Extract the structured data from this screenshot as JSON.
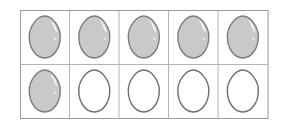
{
  "figure": {
    "type": "egg-grid",
    "background_color": "#ffffff",
    "rows": 2,
    "columns": 5,
    "total_cells": 10,
    "filled_count": 6,
    "empty_count": 4,
    "fraction_shaded": "6/10"
  },
  "grid": {
    "left": 20,
    "top": 10,
    "right": 267.6,
    "bottom": 118,
    "cell_width": 49.52,
    "cell_height": 54,
    "border_color": "#9a9a9a",
    "border_width": 1,
    "inner_line_color": "#b4b4b4",
    "inner_line_width": 1
  },
  "egg_style": {
    "filled_fill_color": "#c9c9c9",
    "filled_stroke_color": "#7c7c7c",
    "empty_fill_color": "#ffffff",
    "empty_stroke_color": "#6e6e6e",
    "stroke_width": 1.4,
    "highlight_color": "#f2f2f2",
    "egg_width": 31,
    "egg_height": 42
  },
  "cells": [
    {
      "id": "cell-r1c1",
      "row": 1,
      "col": 1,
      "state": "filled",
      "label": "shaded egg"
    },
    {
      "id": "cell-r1c2",
      "row": 1,
      "col": 2,
      "state": "filled",
      "label": "shaded egg"
    },
    {
      "id": "cell-r1c3",
      "row": 1,
      "col": 3,
      "state": "filled",
      "label": "shaded egg"
    },
    {
      "id": "cell-r1c4",
      "row": 1,
      "col": 4,
      "state": "filled",
      "label": "shaded egg"
    },
    {
      "id": "cell-r1c5",
      "row": 1,
      "col": 5,
      "state": "filled",
      "label": "shaded egg"
    },
    {
      "id": "cell-r2c1",
      "row": 2,
      "col": 1,
      "state": "filled",
      "label": "shaded egg"
    },
    {
      "id": "cell-r2c2",
      "row": 2,
      "col": 2,
      "state": "empty",
      "label": "unshaded egg"
    },
    {
      "id": "cell-r2c3",
      "row": 2,
      "col": 3,
      "state": "empty",
      "label": "unshaded egg"
    },
    {
      "id": "cell-r2c4",
      "row": 2,
      "col": 4,
      "state": "empty",
      "label": "unshaded egg"
    },
    {
      "id": "cell-r2c5",
      "row": 2,
      "col": 5,
      "state": "empty",
      "label": "unshaded egg"
    }
  ]
}
